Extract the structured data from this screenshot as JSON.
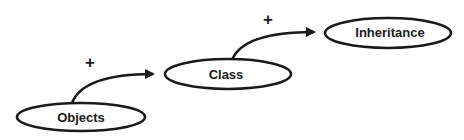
{
  "diagram": {
    "type": "flow",
    "nodes": [
      {
        "id": "objects",
        "label": "Objects"
      },
      {
        "id": "class",
        "label": "Class"
      },
      {
        "id": "inheritance",
        "label": "Inheritance"
      }
    ],
    "edges": [
      {
        "from": "objects",
        "to": "class",
        "label": "+"
      },
      {
        "from": "class",
        "to": "inheritance",
        "label": "+"
      }
    ],
    "colors": {
      "stroke": "#1a1a1a",
      "background": "#ffffff"
    }
  }
}
